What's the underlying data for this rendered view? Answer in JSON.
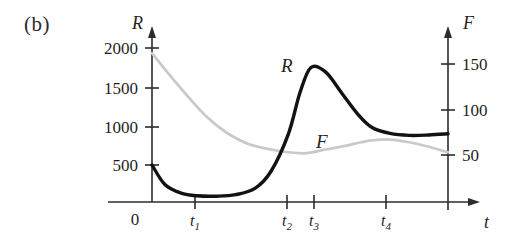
{
  "figure": {
    "panel_label": "(b)",
    "background_color": "#ffffff"
  },
  "axes": {
    "left": {
      "name": "R",
      "tick_labels": [
        "2000",
        "1500",
        "1000",
        "500"
      ],
      "origin_label": "0"
    },
    "right": {
      "name": "F",
      "tick_labels": [
        "150",
        "100",
        "50"
      ]
    },
    "bottom": {
      "name": "t",
      "tick_labels": [
        "t",
        "t",
        "t",
        "t"
      ],
      "tick_subscripts": [
        "1",
        "2",
        "3",
        "4"
      ]
    }
  },
  "curves": {
    "r_label": "R",
    "f_label": "F",
    "r_color": "#121212",
    "f_color": "#c9c9c9"
  },
  "chart_data": {
    "type": "line",
    "title": "",
    "subtitle": "",
    "xlabel": "t",
    "ylabel": "R",
    "y2label": "F",
    "grid": false,
    "legend": "inline-curve-labels",
    "xlim": [
      0,
      4.6
    ],
    "ylim": [
      0,
      2150
    ],
    "y2lim": [
      0,
      185
    ],
    "x_tick_labels": [
      "0",
      "t₁",
      "t₂",
      "t₃",
      "t₄"
    ],
    "x_tick_values": [
      0,
      1,
      2.12,
      2.47,
      3.42
    ],
    "y_tick_values": [
      500,
      1000,
      1500,
      2000
    ],
    "y_tick_labels": [
      "500",
      "1000",
      "1500",
      "2000"
    ],
    "y2_tick_values": [
      50,
      100,
      150
    ],
    "y2_tick_labels": [
      "50",
      "100",
      "150"
    ],
    "series": [
      {
        "name": "R",
        "axis": "left",
        "color": "#121212",
        "style": "solid-thick",
        "x": [
          0.0,
          0.2,
          0.45,
          0.7,
          1.0,
          1.3,
          1.6,
          1.85,
          2.12,
          2.3,
          2.47,
          2.7,
          2.95,
          3.2,
          3.42,
          3.7,
          4.0,
          4.3,
          4.6
        ],
        "values": [
          500,
          250,
          140,
          105,
          100,
          120,
          200,
          420,
          900,
          1430,
          1750,
          1690,
          1420,
          1150,
          980,
          905,
          880,
          885,
          900
        ]
      },
      {
        "name": "F",
        "axis": "right",
        "color": "#c9c9c9",
        "style": "solid-light",
        "x": [
          0.0,
          0.25,
          0.55,
          0.85,
          1.15,
          1.5,
          1.85,
          2.12,
          2.4,
          2.7,
          3.0,
          3.25,
          3.42,
          3.7,
          4.0,
          4.3,
          4.6
        ],
        "values": [
          162,
          140,
          115,
          92,
          75,
          62,
          56,
          53,
          52,
          56,
          60,
          64,
          66,
          67,
          64,
          59,
          53
        ]
      }
    ],
    "annotations": [
      {
        "text": "R",
        "x": 2.12,
        "y": 1730,
        "axis": "left"
      },
      {
        "text": "F",
        "x": 2.78,
        "y": 790,
        "axis": "left"
      },
      {
        "text": "(b)",
        "x": 0.0,
        "y": 0.0,
        "role": "panel-label"
      }
    ]
  }
}
